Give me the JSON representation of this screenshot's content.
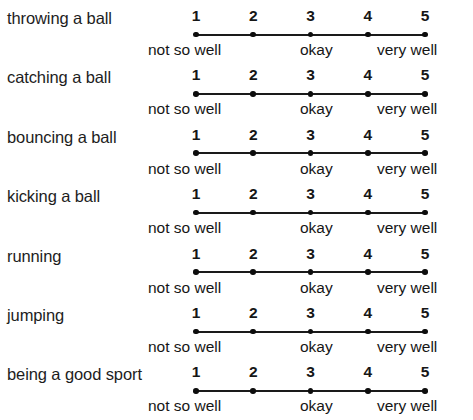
{
  "document": {
    "type": "likert-rating-scale-sheet",
    "background_color": "#ffffff",
    "text_color": "#1a1a1a",
    "scale": {
      "points": [
        "1",
        "2",
        "3",
        "4",
        "5"
      ],
      "anchors": {
        "low": "not so well",
        "mid": "okay",
        "high": "very well"
      }
    },
    "items": [
      {
        "label": "throwing a ball"
      },
      {
        "label": "catching a ball"
      },
      {
        "label": "bouncing a ball"
      },
      {
        "label": "kicking a ball"
      },
      {
        "label": "running"
      },
      {
        "label": "jumping"
      },
      {
        "label": "being a good sport"
      }
    ]
  },
  "chart_data": {
    "type": "table",
    "title": "",
    "categories": [
      "throwing a ball",
      "catching a ball",
      "bouncing a ball",
      "kicking a ball",
      "running",
      "jumping",
      "being a good sport"
    ],
    "scale_values": [
      1,
      2,
      3,
      4,
      5
    ],
    "scale_tick_labels": [
      "1",
      "2",
      "3",
      "4",
      "5"
    ],
    "scale_anchor_labels": [
      "not so well",
      "okay",
      "very well"
    ],
    "scale_anchor_positions": [
      1,
      3,
      5
    ],
    "xlabel": "",
    "ylabel": "",
    "xlim": [
      1,
      5
    ],
    "grid": false,
    "legend": "none",
    "note": "Unmarked self-rating form: each item has an identical 5-point scale with no response selected."
  }
}
